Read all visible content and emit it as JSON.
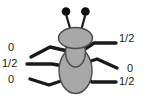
{
  "figure": {
    "colors": {
      "background": "#ffffff",
      "body_fill": "#a8a8a8",
      "body_stroke": "#3c3c3c",
      "leg_stroke": "#1a1a1a",
      "antenna_stroke": "#1a1a1a",
      "antenna_tip_fill": "#0d0d0d",
      "label_text": "#1a1a1a"
    },
    "parts": {
      "head": "head-ellipse",
      "thorax": "thorax-oval",
      "abdomen": "abdomen-oval",
      "antennae": "antenna-pair",
      "antenna_tips": "antenna-tip-dots"
    }
  },
  "legs": {
    "left": [
      {
        "id": "left-front-leg",
        "label": "0"
      },
      {
        "id": "left-middle-leg",
        "label": "1/2"
      },
      {
        "id": "left-hind-leg",
        "label": "0"
      }
    ],
    "right": [
      {
        "id": "right-front-leg",
        "label": "1/2"
      },
      {
        "id": "right-middle-leg",
        "label": "0"
      },
      {
        "id": "right-hind-leg",
        "label": "1/2"
      }
    ]
  }
}
